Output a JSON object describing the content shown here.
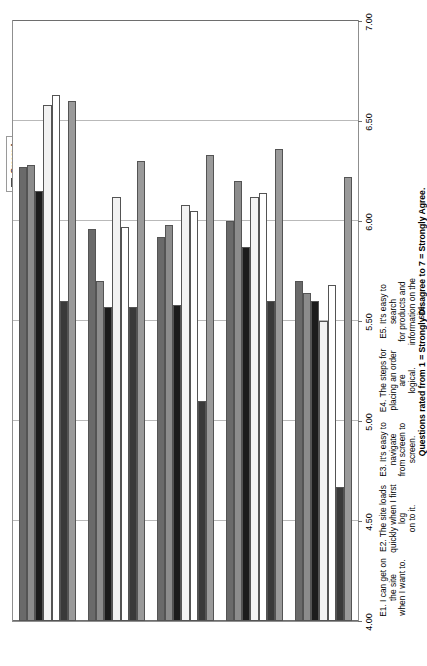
{
  "chart": {
    "type": "bar",
    "orientation": "rotated-90-ccw",
    "axis_title": "Questions rated from 1 = Strongly Disagree to 7 = Strongly Agree."
  },
  "legend": {
    "position": "top-right",
    "items": [
      {
        "label": "Grocer A",
        "color": "#9a9a9a"
      },
      {
        "label": "Grocer B",
        "color": "#3a3a3a"
      },
      {
        "label": "Grocer C",
        "color": "#ffffff"
      },
      {
        "label": "Grocer D",
        "color": "#f2f2f2"
      },
      {
        "label": "Grocer E",
        "color": "#1c1c1c"
      },
      {
        "label": "Grocer F",
        "color": "#8c8c8c"
      },
      {
        "label": "Grocer G",
        "color": "#6a6a6a"
      }
    ]
  },
  "yaxis": {
    "ticks": [
      "7.00",
      "6.50",
      "6.00",
      "5.50",
      "5.00",
      "4.50",
      "4.00"
    ],
    "min": 4.0,
    "max": 7.0,
    "step": 0.5
  },
  "chart_data": {
    "type": "bar",
    "title": "",
    "subtitle": "",
    "xlabel": "Questions rated from 1 = Strongly Disagree to 7 = Strongly Agree.",
    "ylabel": "",
    "ylim": [
      4.0,
      7.0
    ],
    "ytick_step": 0.5,
    "grid": true,
    "legend_position": "top-right",
    "categories": [
      "E1.  I can get on the site when I want to.",
      "E2.  The site loads quickly when I first log on to it.",
      "E3.  It's easy to navigate from screen to screen.",
      "E4.  The steps for placing an order are logical.",
      "E5.  It's easy to search for products and information on the site."
    ],
    "category_lines": [
      [
        "E1.  I can get on the site",
        "when I want to."
      ],
      [
        "E2.  The site loads",
        "quickly when I first log",
        "on to it."
      ],
      [
        "E3.  It's easy to navigate",
        "from screen to screen."
      ],
      [
        "E4.  The steps for",
        "placing an order are",
        "logical."
      ],
      [
        "E5.  It's easy to search",
        "for products and",
        "information on the site."
      ]
    ],
    "series": [
      {
        "name": "Grocer A",
        "color": "#9a9a9a",
        "values": [
          6.6,
          6.3,
          6.33,
          6.36,
          6.22
        ]
      },
      {
        "name": "Grocer B",
        "color": "#3a3a3a",
        "values": [
          5.6,
          5.57,
          5.1,
          5.6,
          4.67
        ]
      },
      {
        "name": "Grocer C",
        "color": "#ffffff",
        "values": [
          6.63,
          5.97,
          6.05,
          6.14,
          5.68
        ]
      },
      {
        "name": "Grocer D",
        "color": "#f2f2f2",
        "values": [
          6.58,
          6.12,
          6.08,
          6.12,
          5.5
        ]
      },
      {
        "name": "Grocer E",
        "color": "#1c1c1c",
        "values": [
          6.15,
          5.57,
          5.58,
          5.87,
          5.6
        ]
      },
      {
        "name": "Grocer F",
        "color": "#8c8c8c",
        "values": [
          6.28,
          5.7,
          5.98,
          6.2,
          5.64
        ]
      },
      {
        "name": "Grocer G",
        "color": "#6a6a6a",
        "values": [
          6.27,
          5.96,
          5.92,
          6.0,
          5.7
        ]
      }
    ]
  }
}
